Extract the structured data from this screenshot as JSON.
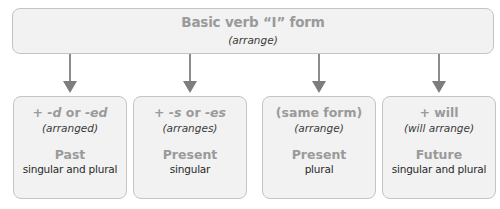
{
  "base": {
    "title": "Basic verb “I” form",
    "example": "(arrange)"
  },
  "forms": [
    {
      "rule_prefix": "+ ",
      "rule_a": "-d",
      "rule_mid": " or ",
      "rule_b": "-ed",
      "example": "(arranged)",
      "tense": "Past",
      "number": "singular and plural"
    },
    {
      "rule_prefix": "+ ",
      "rule_a": "-s",
      "rule_mid": " or ",
      "rule_b": "-es",
      "example": "(arranges)",
      "tense": "Present",
      "number": "singular"
    },
    {
      "rule": "(same form)",
      "example": "(arrange)",
      "tense": "Present",
      "number": "plural"
    },
    {
      "rule": "+ will",
      "example": "(will arrange)",
      "tense": "Future",
      "number": "singular and plural"
    }
  ],
  "colors": {
    "box_fill": "#f2f2f2",
    "box_border": "#c4c4c4",
    "heading_gray": "#9a9a9a",
    "arrow": "#8c8c8c",
    "body_text": "#2a2a2a"
  }
}
